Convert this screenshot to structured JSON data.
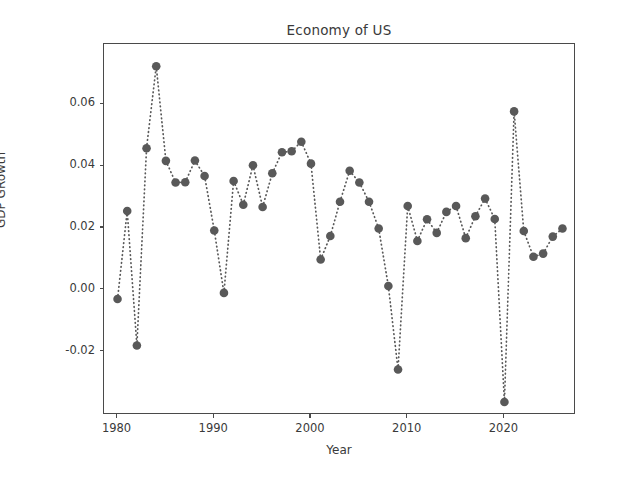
{
  "chart_data": {
    "type": "line",
    "title": "Economy of US",
    "xlabel": "Year",
    "ylabel": "GDP GRowth",
    "grid": false,
    "legend": null,
    "marker": "circle",
    "linestyle": "dotted",
    "color": "#595959",
    "xlim": [
      1978.6,
      1027.4
    ],
    "ylim": [
      -0.0405,
      0.0795
    ],
    "xticks": [
      1980,
      1990,
      2000,
      2010,
      2020
    ],
    "xtick_labels": [
      "1980",
      "1990",
      "2000",
      "2010",
      "2020"
    ],
    "yticks": [
      -0.02,
      0.0,
      0.02,
      0.04,
      0.06
    ],
    "ytick_labels": [
      "-0.02",
      "0.00",
      "0.02",
      "0.04",
      "0.06"
    ],
    "x": [
      1980,
      1981,
      1982,
      1983,
      1984,
      1985,
      1986,
      1987,
      1988,
      1989,
      1990,
      1991,
      1992,
      1993,
      1994,
      1995,
      1996,
      1997,
      1998,
      1999,
      2000,
      2001,
      2002,
      2003,
      2004,
      2005,
      2006,
      2007,
      2008,
      2009,
      2010,
      2011,
      2012,
      2013,
      2014,
      2015,
      2016,
      2017,
      2018,
      2019,
      2020,
      2021,
      2022,
      2023,
      2024,
      2025,
      2026
    ],
    "values": [
      -0.003,
      0.0255,
      -0.018,
      0.0458,
      0.0723,
      0.0417,
      0.0347,
      0.0348,
      0.0418,
      0.0368,
      0.0192,
      -0.001,
      0.0352,
      0.0275,
      0.0403,
      0.0268,
      0.0377,
      0.0445,
      0.0448,
      0.0479,
      0.0408,
      0.0098,
      0.0174,
      0.0285,
      0.0385,
      0.0347,
      0.0285,
      0.0198,
      0.0012,
      -0.0258,
      0.0271,
      0.0158,
      0.0228,
      0.0184,
      0.0252,
      0.0271,
      0.0167,
      0.0238,
      0.0295,
      0.0229,
      -0.0363,
      0.0577,
      0.019,
      0.0107,
      0.0117,
      0.0172,
      0.0198
    ]
  },
  "figure": {
    "background_color": "#ffffff",
    "axes_color": "#4a4a4a"
  }
}
